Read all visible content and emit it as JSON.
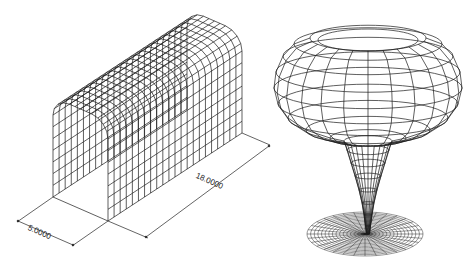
{
  "figure": {
    "left_model": {
      "name": "Tunnel surface mesh",
      "dimensions": {
        "width_label": "5.0000",
        "length_label": "18.0000"
      }
    },
    "right_model": {
      "name": "Surface of revolution (bowl on tapered stem over disc)"
    },
    "colors": {
      "line": "#1a1a1a",
      "background": "#ffffff"
    }
  }
}
